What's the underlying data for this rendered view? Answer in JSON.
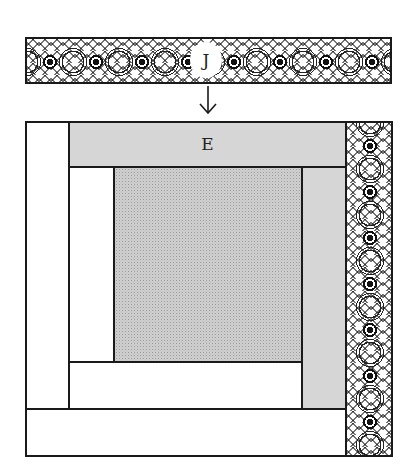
{
  "diagram": {
    "type": "quilt-block-assembly",
    "strip_top": {
      "label": "J",
      "fill": "lace-print",
      "position": "above block"
    },
    "arrow": {
      "direction": "down",
      "glyph": "↓"
    },
    "block": {
      "pieces": [
        {
          "id": "left-outer",
          "fill": "white",
          "label": ""
        },
        {
          "id": "top-band",
          "fill": "gray",
          "label": "E"
        },
        {
          "id": "right-print",
          "fill": "lace-print",
          "label": ""
        },
        {
          "id": "left-inner",
          "fill": "white",
          "label": ""
        },
        {
          "id": "center",
          "fill": "dotted-gray",
          "label": ""
        },
        {
          "id": "right-inner",
          "fill": "gray",
          "label": ""
        },
        {
          "id": "lower-inner",
          "fill": "white",
          "label": ""
        },
        {
          "id": "bottom-outer",
          "fill": "white",
          "label": ""
        }
      ]
    },
    "colors": {
      "outline": "#1a1a1a",
      "gray_fill": "#d6d6d6",
      "center_fill": "#d0d0d0",
      "background": "#ffffff"
    }
  }
}
